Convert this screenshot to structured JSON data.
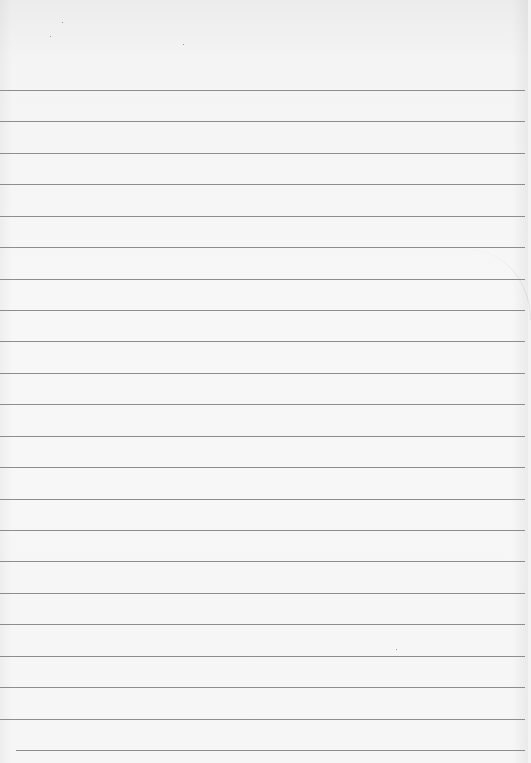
{
  "image": {
    "description": "Blank ruled notebook paper",
    "paper_color": "#f6f6f6",
    "rule_color": "#8d8d8d",
    "rules": {
      "count": 22,
      "first_y": 90,
      "spacing": 31.43,
      "last_indent_x": 16
    },
    "text": []
  }
}
